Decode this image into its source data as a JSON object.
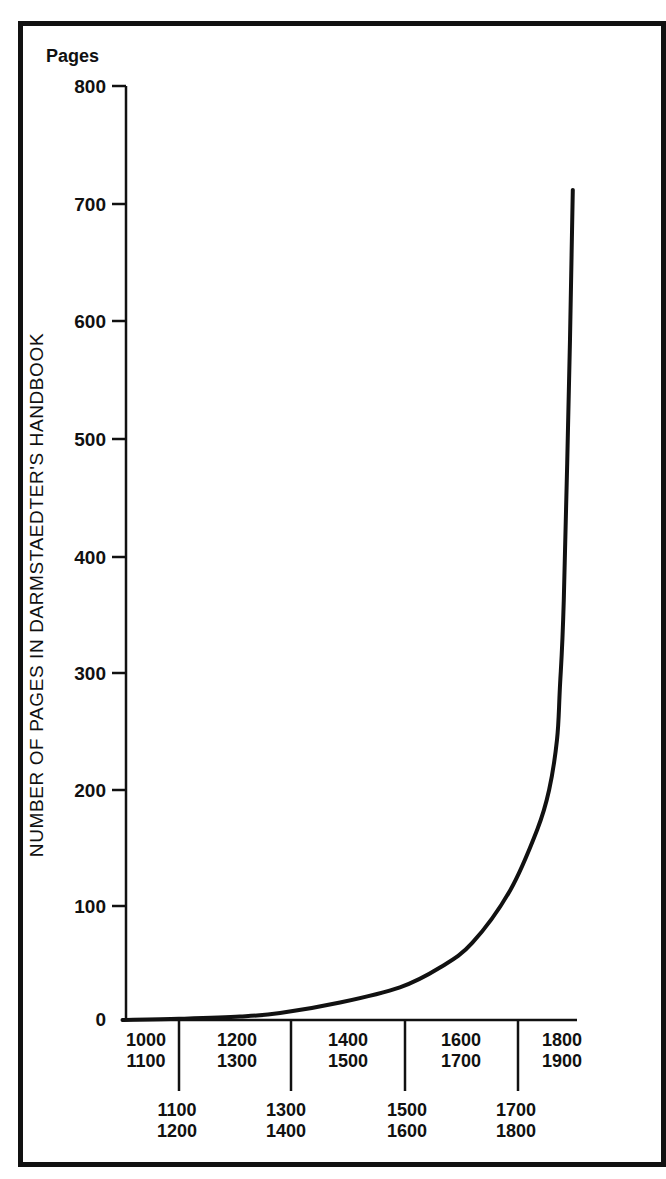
{
  "chart_data": {
    "type": "line",
    "title": "",
    "ylabel": "NUMBER OF PAGES IN DARMSTAEDTER'S HANDBOOK",
    "yunit_label": "Pages",
    "xlabel": "",
    "ylim": [
      0,
      800
    ],
    "yticks": [
      0,
      100,
      200,
      300,
      400,
      500,
      600,
      700,
      800
    ],
    "ytick_labels": [
      "0",
      "100",
      "200",
      "300",
      "400",
      "500",
      "600",
      "700",
      "800"
    ],
    "xlim": [
      1000,
      1900
    ],
    "x_period_labels_upper": [
      {
        "line1": "1000",
        "line2": "1100"
      },
      {
        "line1": "1200",
        "line2": "1300"
      },
      {
        "line1": "1400",
        "line2": "1500"
      },
      {
        "line1": "1600",
        "line2": "1700"
      },
      {
        "line1": "1800",
        "line2": "1900"
      }
    ],
    "x_period_labels_lower": [
      {
        "line1": "1100",
        "line2": "1200"
      },
      {
        "line1": "1300",
        "line2": "1400"
      },
      {
        "line1": "1500",
        "line2": "1600"
      },
      {
        "line1": "1700",
        "line2": "1800"
      }
    ],
    "grid": false,
    "legend": null,
    "series": [
      {
        "name": "Pages",
        "x": [
          1000,
          1100,
          1208,
          1279,
          1385,
          1491,
          1562,
          1619,
          1686,
          1734,
          1755,
          1769,
          1774,
          1781,
          1792,
          1797
        ],
        "y": [
          0,
          1,
          3,
          6,
          15,
          28,
          45,
          66,
          111,
          163,
          197,
          240,
          283,
          360,
          583,
          711
        ]
      }
    ]
  },
  "labels": {
    "pages": "Pages",
    "ylabel": "NUMBER OF PAGES IN DARMSTAEDTER'S HANDBOOK",
    "y0": "0",
    "y100": "100",
    "y200": "200",
    "y300": "300",
    "y400": "400",
    "y500": "500",
    "y600": "600",
    "y700": "700",
    "y800": "800",
    "u0a": "1000",
    "u0b": "1100",
    "u1a": "1200",
    "u1b": "1300",
    "u2a": "1400",
    "u2b": "1500",
    "u3a": "1600",
    "u3b": "1700",
    "u4a": "1800",
    "u4b": "1900",
    "l0a": "1100",
    "l0b": "1200",
    "l1a": "1300",
    "l1b": "1400",
    "l2a": "1500",
    "l2b": "1600",
    "l3a": "1700",
    "l3b": "1800"
  }
}
